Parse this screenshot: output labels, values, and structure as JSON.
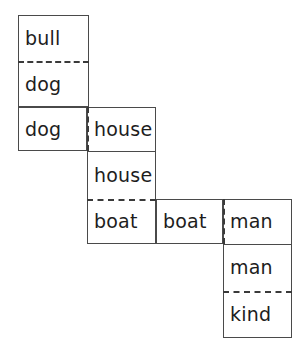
{
  "diagram": {
    "type": "staircase-alignment-grid",
    "canvas": {
      "width": 305,
      "height": 351,
      "background": "#ffffff"
    },
    "style": {
      "line_color": "#4a4a4a",
      "dash_color": "#3a3a3a",
      "text_color": "#1d1d1d",
      "font_size_px": 19
    },
    "cells": [
      {
        "id": "c1",
        "label": "bull",
        "x": 18,
        "y": 15,
        "w": 71,
        "h": 46
      },
      {
        "id": "c2",
        "label": "dog",
        "x": 18,
        "y": 61,
        "w": 71,
        "h": 46
      },
      {
        "id": "c3",
        "label": "dog",
        "x": 18,
        "y": 107,
        "w": 69,
        "h": 44
      },
      {
        "id": "c4",
        "label": "house",
        "x": 87,
        "y": 107,
        "w": 69,
        "h": 44
      },
      {
        "id": "c5",
        "label": "house",
        "x": 87,
        "y": 151,
        "w": 69,
        "h": 48
      },
      {
        "id": "c6",
        "label": "boat",
        "x": 87,
        "y": 199,
        "w": 69,
        "h": 45
      },
      {
        "id": "c7",
        "label": "boat",
        "x": 156,
        "y": 199,
        "w": 67,
        "h": 45
      },
      {
        "id": "c8",
        "label": "man",
        "x": 223,
        "y": 199,
        "w": 69,
        "h": 45
      },
      {
        "id": "c9",
        "label": "man",
        "x": 223,
        "y": 244,
        "w": 69,
        "h": 47
      },
      {
        "id": "c10",
        "label": "kind",
        "x": 223,
        "y": 291,
        "w": 69,
        "h": 47
      }
    ],
    "boxes": [
      {
        "id": "b1",
        "x": 18,
        "y": 15,
        "w": 71,
        "h": 92
      },
      {
        "id": "b2",
        "x": 18,
        "y": 107,
        "w": 69,
        "h": 44
      },
      {
        "id": "b3",
        "x": 87,
        "y": 107,
        "w": 69,
        "h": 137
      },
      {
        "id": "b4",
        "x": 156,
        "y": 199,
        "w": 67,
        "h": 45
      },
      {
        "id": "b5",
        "x": 223,
        "y": 199,
        "w": 69,
        "h": 139
      }
    ],
    "separators": [
      {
        "id": "s1",
        "kind": "dashed-horizontal",
        "x": 18,
        "y": 61,
        "len": 71
      },
      {
        "id": "s2",
        "kind": "dashed-vertical",
        "x": 87,
        "y": 107,
        "len": 44
      },
      {
        "id": "s3",
        "kind": "solid-horizontal",
        "x": 87,
        "y": 151,
        "len": 69
      },
      {
        "id": "s4",
        "kind": "dashed-horizontal",
        "x": 87,
        "y": 199,
        "len": 69
      },
      {
        "id": "s5",
        "kind": "dashed-vertical",
        "x": 223,
        "y": 199,
        "len": 45
      },
      {
        "id": "s6",
        "kind": "solid-horizontal",
        "x": 223,
        "y": 244,
        "len": 69
      },
      {
        "id": "s7",
        "kind": "dashed-horizontal",
        "x": 223,
        "y": 291,
        "len": 69
      }
    ]
  }
}
